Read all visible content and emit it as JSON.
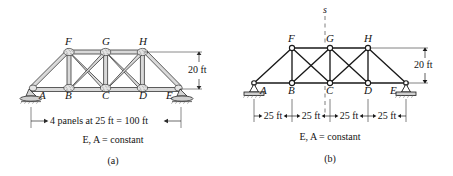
{
  "figure": {
    "colors": {
      "line": "#1a1a1a",
      "member_fill": "#d8d8d8",
      "member_stroke": "#2b2b2b",
      "gusset_fill": "#e2e2e2",
      "support_fill": "#cfcfcf",
      "text": "#141414",
      "dashed": "#6e6e6e",
      "background": "#ffffff"
    },
    "panels": [
      {
        "id": "a",
        "caption": "(a)",
        "note": "E, A = constant",
        "height_dim": "20 ft",
        "span_dim": "4 panels at 25 ft = 100 ft",
        "style": "pictorial",
        "bottom_nodes": [
          {
            "label": "A",
            "x": 0,
            "y": 0
          },
          {
            "label": "B",
            "x": 25,
            "y": 0
          },
          {
            "label": "C",
            "x": 50,
            "y": 0
          },
          {
            "label": "D",
            "x": 75,
            "y": 0
          },
          {
            "label": "E",
            "x": 100,
            "y": 0
          }
        ],
        "top_nodes": [
          {
            "label": "F",
            "x": 25,
            "y": 20
          },
          {
            "label": "G",
            "x": 50,
            "y": 20
          },
          {
            "label": "H",
            "x": 75,
            "y": 20
          }
        ],
        "supports": [
          {
            "node": "A",
            "type": "pin-rocker"
          },
          {
            "node": "E",
            "type": "rocker"
          }
        ]
      },
      {
        "id": "b",
        "caption": "(b)",
        "note": "E, A = constant",
        "height_dim": "20 ft",
        "axis_label": "s",
        "style": "line",
        "span_segments": [
          "25 ft",
          "25 ft",
          "25 ft",
          "25 ft"
        ],
        "bottom_nodes": [
          {
            "label": "A",
            "x": 0,
            "y": 0
          },
          {
            "label": "B",
            "x": 25,
            "y": 0
          },
          {
            "label": "C",
            "x": 50,
            "y": 0
          },
          {
            "label": "D",
            "x": 75,
            "y": 0
          },
          {
            "label": "E",
            "x": 100,
            "y": 0
          }
        ],
        "top_nodes": [
          {
            "label": "F",
            "x": 25,
            "y": 20
          },
          {
            "label": "G",
            "x": 50,
            "y": 20
          },
          {
            "label": "H",
            "x": 75,
            "y": 20
          }
        ],
        "supports": [
          {
            "node": "A",
            "type": "pin"
          },
          {
            "node": "E",
            "type": "roller"
          }
        ]
      }
    ]
  }
}
